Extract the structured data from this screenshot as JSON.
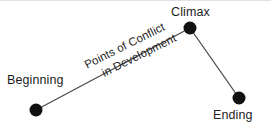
{
  "diagram": {
    "background_color": "#ffffff",
    "line_color": "#4a4a4a",
    "dot_color": "#111111",
    "text_color": "#1c1c1c",
    "nodes": [
      {
        "id": "beginning",
        "label": "Beginning",
        "x": 36,
        "y": 109,
        "radius": 6.5
      },
      {
        "id": "climax",
        "label": "Climax",
        "x": 190,
        "y": 27,
        "radius": 6.5
      },
      {
        "id": "ending",
        "label": "Ending",
        "x": 239,
        "y": 97,
        "radius": 6.5
      }
    ],
    "edges": [
      {
        "id": "rising-action",
        "from": "beginning",
        "to": "climax"
      },
      {
        "id": "falling-action",
        "from": "climax",
        "to": "ending"
      }
    ],
    "annotation": {
      "id": "points-of-conflict",
      "line1": "Points of Conflict",
      "line2": "in Development",
      "rotation_degrees": -26.5
    }
  }
}
